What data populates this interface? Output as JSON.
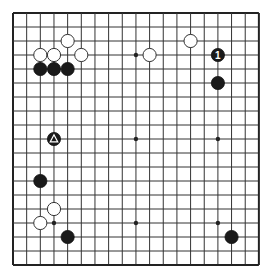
{
  "board": {
    "size": 19,
    "origin": {
      "x": 13,
      "y": 13
    },
    "spacing": {
      "x": 13.66,
      "y": 14.0
    },
    "line_color": "#333333",
    "border_color": "#222222",
    "background": "#ffffff",
    "star_points": [
      [
        3,
        3
      ],
      [
        9,
        3
      ],
      [
        15,
        3
      ],
      [
        3,
        9
      ],
      [
        9,
        9
      ],
      [
        15,
        9
      ],
      [
        3,
        15
      ],
      [
        9,
        15
      ],
      [
        15,
        15
      ]
    ]
  },
  "stones": [
    {
      "color": "white",
      "col": 4,
      "row": 2
    },
    {
      "color": "white",
      "col": 2,
      "row": 3
    },
    {
      "color": "white",
      "col": 3,
      "row": 3
    },
    {
      "color": "white",
      "col": 5,
      "row": 3
    },
    {
      "color": "black",
      "col": 2,
      "row": 4
    },
    {
      "color": "black",
      "col": 3,
      "row": 4
    },
    {
      "color": "black",
      "col": 4,
      "row": 4
    },
    {
      "color": "white",
      "col": 10,
      "row": 3
    },
    {
      "color": "white",
      "col": 13,
      "row": 2
    },
    {
      "color": "black",
      "col": 15,
      "row": 3,
      "label": "1"
    },
    {
      "color": "black",
      "col": 15,
      "row": 5
    },
    {
      "color": "black",
      "col": 3,
      "row": 9,
      "marker": "triangle"
    },
    {
      "color": "black",
      "col": 2,
      "row": 12
    },
    {
      "color": "white",
      "col": 3,
      "row": 14
    },
    {
      "color": "white",
      "col": 2,
      "row": 15
    },
    {
      "color": "black",
      "col": 4,
      "row": 16
    },
    {
      "color": "black",
      "col": 16,
      "row": 16
    }
  ]
}
